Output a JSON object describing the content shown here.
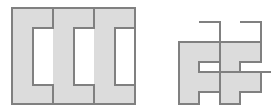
{
  "figure": {
    "width": 271,
    "height": 112,
    "background_color": "#ffffff",
    "stroke_color": "#808080",
    "stroke_width": 1.2,
    "fill_color": "#dcdcdc",
    "white_fill": "#ffffff",
    "panels": [
      {
        "name": "left-panel",
        "label": "three interlocking comb tiles packed into a square",
        "tile_count": 3,
        "bounding_box": {
          "x": 12,
          "y": 8,
          "width": 123,
          "height": 96
        }
      },
      {
        "name": "right-panel",
        "label": "interlocking E shaped tiles, clipped at right edge",
        "tile_count": 2,
        "bounding_box": {
          "x": 179,
          "y": 22,
          "width": 92,
          "height": 82
        }
      }
    ]
  },
  "shapes": {
    "left": [
      {
        "name": "comb-tile-1",
        "fill": "#dcdcdc",
        "points": "12,8 53,8 53,28 33,28 33,85 53,85 53,104 12,104"
      },
      {
        "name": "comb-tile-2",
        "fill": "#dcdcdc",
        "points": "53,8 94,8 94,28 74,28 74,85 94,85 94,104 53,104 53,85 33,85 33,28 53,28"
      },
      {
        "name": "comb-tile-3",
        "fill": "#dcdcdc",
        "points": "94,8 135,8 135,28 115,28 115,85 135,85 135,104 94,104 94,85 74,85 74,28 94,28"
      },
      {
        "name": "comb-notch-1",
        "fill": "#ffffff",
        "points": "33,28 53,28 53,85 33,85"
      },
      {
        "name": "comb-notch-2",
        "fill": "#ffffff",
        "points": "74,28 94,28 94,85 74,85"
      },
      {
        "name": "comb-notch-3",
        "fill": "#ffffff",
        "points": "115,28 135,28 135,85 115,85"
      },
      {
        "name": "left-panel-frame",
        "fill": "none",
        "points": "12,8 135,8 135,104 12,104"
      },
      {
        "name": "divider-line-1",
        "fill": "none",
        "points": "53,8 53,104"
      },
      {
        "name": "divider-line-2",
        "fill": "none",
        "points": "94,8 94,104"
      }
    ],
    "right": [
      {
        "name": "e-tile-1-body",
        "fill": "#dcdcdc",
        "points": "179,42 199,42 199,22 220,22 220,42 199,42 199,62 179,62"
      },
      {
        "name": "e-tile-1",
        "fill": "#dcdcdc",
        "points": "179,42 220,42 220,62 199,62 199,72 220,72 220,92 199,92 199,104 179,104"
      },
      {
        "name": "e-tile-2",
        "fill": "#dcdcdc",
        "points": "220,42 261,42 261,62 240,62 240,72 261,72 261,92 240,92 240,104 220,104"
      },
      {
        "name": "e-arm-1",
        "fill": "#ffffff",
        "points": "199,22 220,22 220,42 199,42"
      },
      {
        "name": "e-arm-2",
        "fill": "#ffffff",
        "points": "240,22 261,22 261,42 240,42"
      },
      {
        "name": "e-slot-1",
        "fill": "#ffffff",
        "points": "199,62 220,62 220,72 199,72"
      },
      {
        "name": "e-slot-2",
        "fill": "#ffffff",
        "points": "240,62 261,62 261,72 240,72"
      },
      {
        "name": "e-stem-1",
        "fill": "#ffffff",
        "points": "199,92 220,92 220,104 199,104"
      },
      {
        "name": "e-stem-2",
        "fill": "#ffffff",
        "points": "240,92 261,92 261,104 240,104"
      }
    ]
  }
}
